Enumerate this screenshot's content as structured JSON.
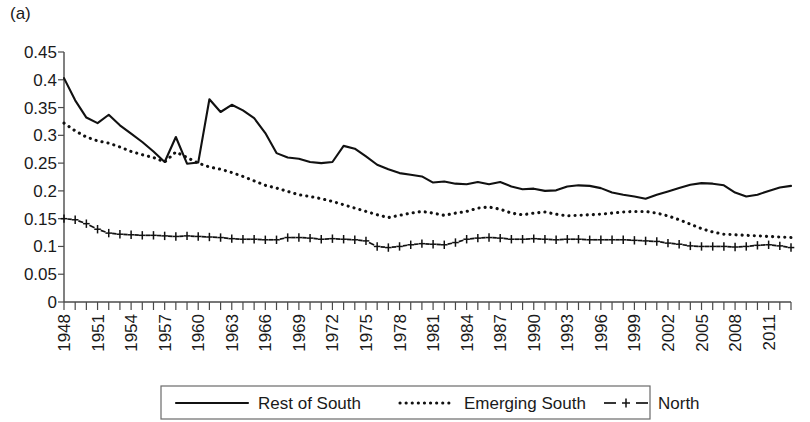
{
  "panel": {
    "label": "(a)"
  },
  "legend": {
    "position": "bottom-center",
    "entries": [
      {
        "label": "Rest of South",
        "style": "solid"
      },
      {
        "label": "Emerging South",
        "style": "dotted"
      },
      {
        "label": "North",
        "style": "dashed-plus"
      }
    ]
  },
  "axes": {
    "y_ticks": [
      "0",
      "0.05",
      "0.1",
      "0.15",
      "0.2",
      "0.25",
      "0.3",
      "0.35",
      "0.4",
      "0.45"
    ],
    "x_ticks": [
      "1948",
      "1951",
      "1954",
      "1957",
      "1960",
      "1963",
      "1966",
      "1969",
      "1972",
      "1975",
      "1978",
      "1981",
      "1984",
      "1987",
      "1990",
      "1993",
      "1996",
      "1999",
      "2002",
      "2005",
      "2008",
      "2011"
    ]
  },
  "colors": {
    "ink": "#111111",
    "axis": "#4a4a4a",
    "legend_border": "#6a6a6a",
    "background": "#ffffff"
  },
  "chart_data": {
    "type": "line",
    "title": "",
    "subtitle": "",
    "xlabel": "",
    "ylabel": "",
    "xlim": [
      1948,
      2013
    ],
    "ylim": [
      0,
      0.45
    ],
    "ytick_step": 0.05,
    "xtick_step": 1,
    "xtick_label_step": 3,
    "grid": false,
    "legend_position": "bottom-center",
    "x": [
      1948,
      1949,
      1950,
      1951,
      1952,
      1953,
      1954,
      1955,
      1956,
      1957,
      1958,
      1959,
      1960,
      1961,
      1962,
      1963,
      1964,
      1965,
      1966,
      1967,
      1968,
      1969,
      1970,
      1971,
      1972,
      1973,
      1974,
      1975,
      1976,
      1977,
      1978,
      1979,
      1980,
      1981,
      1982,
      1983,
      1984,
      1985,
      1986,
      1987,
      1988,
      1989,
      1990,
      1991,
      1992,
      1993,
      1994,
      1995,
      1996,
      1997,
      1998,
      1999,
      2000,
      2001,
      2002,
      2003,
      2004,
      2005,
      2006,
      2007,
      2008,
      2009,
      2010,
      2011,
      2012,
      2013
    ],
    "series": [
      {
        "name": "Rest of South",
        "style": "solid",
        "values": [
          0.403,
          0.363,
          0.332,
          0.322,
          0.337,
          0.318,
          0.303,
          0.288,
          0.271,
          0.252,
          0.297,
          0.249,
          0.251,
          0.365,
          0.342,
          0.355,
          0.345,
          0.331,
          0.304,
          0.268,
          0.26,
          0.258,
          0.252,
          0.25,
          0.252,
          0.281,
          0.276,
          0.262,
          0.247,
          0.239,
          0.232,
          0.229,
          0.226,
          0.215,
          0.217,
          0.213,
          0.212,
          0.216,
          0.212,
          0.216,
          0.208,
          0.203,
          0.204,
          0.2,
          0.201,
          0.208,
          0.21,
          0.209,
          0.205,
          0.197,
          0.193,
          0.19,
          0.186,
          0.193,
          0.199,
          0.205,
          0.211,
          0.214,
          0.213,
          0.21,
          0.197,
          0.19,
          0.193,
          0.2,
          0.206,
          0.209
        ]
      },
      {
        "name": "Emerging South",
        "style": "dotted",
        "values": [
          0.322,
          0.308,
          0.297,
          0.29,
          0.286,
          0.279,
          0.271,
          0.265,
          0.26,
          0.252,
          0.27,
          0.26,
          0.25,
          0.243,
          0.239,
          0.233,
          0.226,
          0.218,
          0.21,
          0.205,
          0.199,
          0.193,
          0.19,
          0.186,
          0.181,
          0.175,
          0.169,
          0.163,
          0.157,
          0.152,
          0.156,
          0.16,
          0.163,
          0.16,
          0.156,
          0.16,
          0.163,
          0.169,
          0.171,
          0.167,
          0.16,
          0.157,
          0.16,
          0.162,
          0.158,
          0.155,
          0.156,
          0.157,
          0.158,
          0.16,
          0.162,
          0.163,
          0.163,
          0.16,
          0.155,
          0.148,
          0.14,
          0.132,
          0.126,
          0.122,
          0.121,
          0.12,
          0.119,
          0.118,
          0.117,
          0.116
        ]
      },
      {
        "name": "North",
        "style": "dashed-plus",
        "values": [
          0.15,
          0.148,
          0.141,
          0.131,
          0.124,
          0.122,
          0.121,
          0.12,
          0.12,
          0.119,
          0.118,
          0.119,
          0.118,
          0.117,
          0.116,
          0.114,
          0.113,
          0.113,
          0.112,
          0.112,
          0.116,
          0.116,
          0.115,
          0.113,
          0.114,
          0.113,
          0.112,
          0.11,
          0.1,
          0.098,
          0.1,
          0.103,
          0.105,
          0.104,
          0.103,
          0.107,
          0.113,
          0.115,
          0.116,
          0.115,
          0.113,
          0.113,
          0.114,
          0.113,
          0.112,
          0.113,
          0.113,
          0.112,
          0.112,
          0.112,
          0.112,
          0.111,
          0.11,
          0.109,
          0.106,
          0.104,
          0.101,
          0.1,
          0.1,
          0.1,
          0.099,
          0.1,
          0.102,
          0.103,
          0.101,
          0.098
        ]
      }
    ]
  }
}
